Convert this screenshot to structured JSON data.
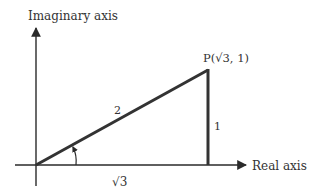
{
  "diagram": {
    "type": "complex-plane-triangle",
    "axes": {
      "vertical_label": "Imaginary axis",
      "horizontal_label": "Real axis"
    },
    "point": {
      "label": "P(√3, 1)",
      "re": "√3",
      "im": "1"
    },
    "sides": {
      "hypotenuse": "2",
      "vertical": "1",
      "base": "√3"
    },
    "colors": {
      "axis": "#2a2a2a",
      "triangle": "#333333",
      "text": "#333333"
    }
  }
}
